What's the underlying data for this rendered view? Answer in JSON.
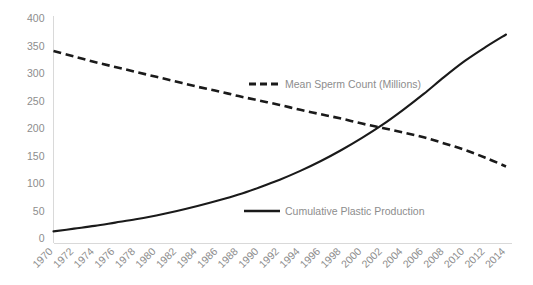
{
  "chart_data": {
    "type": "line",
    "title": "",
    "subtitle": "",
    "xlabel": "",
    "ylabel": "",
    "grid": false,
    "legend_position": "inline",
    "xlim": [
      1970,
      2014
    ],
    "ylim": [
      0,
      400
    ],
    "yticks": [
      0,
      50,
      100,
      150,
      200,
      250,
      300,
      350,
      400
    ],
    "ytick_labels": [
      "0",
      "50",
      "100",
      "150",
      "200",
      "250",
      "300",
      "350",
      "400"
    ],
    "x": [
      1970,
      1972,
      1974,
      1976,
      1978,
      1980,
      1982,
      1984,
      1986,
      1988,
      1990,
      1992,
      1994,
      1996,
      1998,
      2000,
      2002,
      2004,
      2006,
      2008,
      2010,
      2012,
      2014
    ],
    "xtick_labels": [
      "1970",
      "1972",
      "1974",
      "1976",
      "1978",
      "1980",
      "1982",
      "1984",
      "1986",
      "1988",
      "1990",
      "1992",
      "1994",
      "1996",
      "1998",
      "2000",
      "2002",
      "2004",
      "2006",
      "2008",
      "2010",
      "2012",
      "2014"
    ],
    "series": [
      {
        "name": "Mean Sperm Count (Millions)",
        "style": "dashed",
        "color": "#1a1a1a",
        "values": [
          340,
          330,
          320,
          311,
          302,
          293,
          284,
          275,
          267,
          258,
          250,
          242,
          233,
          225,
          217,
          208,
          200,
          192,
          183,
          172,
          160,
          146,
          130
        ]
      },
      {
        "name": "Cumulative  Plastic Production",
        "style": "solid",
        "color": "#1a1a1a",
        "values": [
          12,
          17,
          22,
          28,
          34,
          41,
          49,
          58,
          68,
          79,
          92,
          106,
          122,
          140,
          160,
          182,
          206,
          233,
          262,
          293,
          322,
          347,
          370
        ]
      }
    ],
    "annotations": {
      "crossover_year": 2001,
      "crossover_value": 185
    },
    "colors": {
      "line": "#1a1a1a",
      "text": "#8d8d8d",
      "axis": "#d9d9d9",
      "background": "#ffffff"
    }
  },
  "legend": {
    "items": [
      {
        "label": "Mean Sperm Count (Millions)",
        "style": "dashed"
      },
      {
        "label": "Cumulative  Plastic Production",
        "style": "solid"
      }
    ]
  }
}
